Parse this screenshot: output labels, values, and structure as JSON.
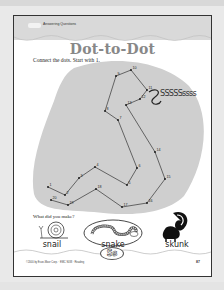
{
  "worksheet": {
    "section_label": "Answering Questions",
    "title": "Dot-to-Dot",
    "instruction": "Connect the dots. Start with 1.",
    "hiss_text": "SSSSSssss",
    "question": "What did you make?",
    "answers": [
      {
        "label": "snail",
        "circled": false
      },
      {
        "label": "snake",
        "circled": true
      },
      {
        "label": "skunk",
        "circled": false
      }
    ],
    "letter_badge": "Ss",
    "footer_copyright": "©2000 by Evan-Moor Corp. · EMC 9038 · Reading",
    "page_number": "87"
  },
  "dots": [
    {
      "n": "1",
      "x": 34,
      "y": 171
    },
    {
      "n": "2",
      "x": 51,
      "y": 179
    },
    {
      "n": "3",
      "x": 65,
      "y": 162
    },
    {
      "n": "4",
      "x": 81,
      "y": 151
    },
    {
      "n": "5",
      "x": 113,
      "y": 169
    },
    {
      "n": "6",
      "x": 123,
      "y": 152
    },
    {
      "n": "7",
      "x": 104,
      "y": 104
    },
    {
      "n": "8",
      "x": 91,
      "y": 95
    },
    {
      "n": "9",
      "x": 102,
      "y": 60
    },
    {
      "n": "10",
      "x": 117,
      "y": 54
    },
    {
      "n": "11",
      "x": 133,
      "y": 74
    },
    {
      "n": "12",
      "x": 126,
      "y": 83
    },
    {
      "n": "13",
      "x": 112,
      "y": 89
    },
    {
      "n": "14",
      "x": 141,
      "y": 136
    },
    {
      "n": "15",
      "x": 151,
      "y": 163
    },
    {
      "n": "16",
      "x": 133,
      "y": 187
    },
    {
      "n": "17",
      "x": 108,
      "y": 191
    },
    {
      "n": "18",
      "x": 82,
      "y": 173
    },
    {
      "n": "19",
      "x": 54,
      "y": 189
    },
    {
      "n": "20",
      "x": 37,
      "y": 184
    }
  ],
  "colors": {
    "header_band": "#d9d9d9",
    "blob": "#cfcfcf",
    "title": "#888888",
    "line": "#333333"
  }
}
